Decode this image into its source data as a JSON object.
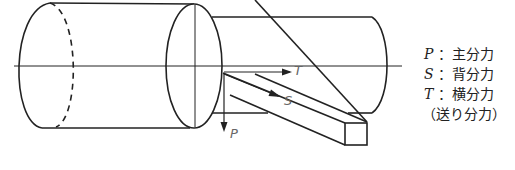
{
  "diagram": {
    "title": "",
    "force_labels": {
      "P": "P",
      "S": "S",
      "T": "T"
    },
    "legend": [
      {
        "symbol": "P",
        "separator": "：",
        "label": "主分力"
      },
      {
        "symbol": "S",
        "separator": "：",
        "label": "背分力"
      },
      {
        "symbol": "T",
        "separator": "：",
        "label": "横分力"
      },
      {
        "symbol": "",
        "separator": "",
        "label": "（送り分力）"
      }
    ],
    "colors": {
      "line": "#222222",
      "arrow_label": "#666666"
    }
  }
}
